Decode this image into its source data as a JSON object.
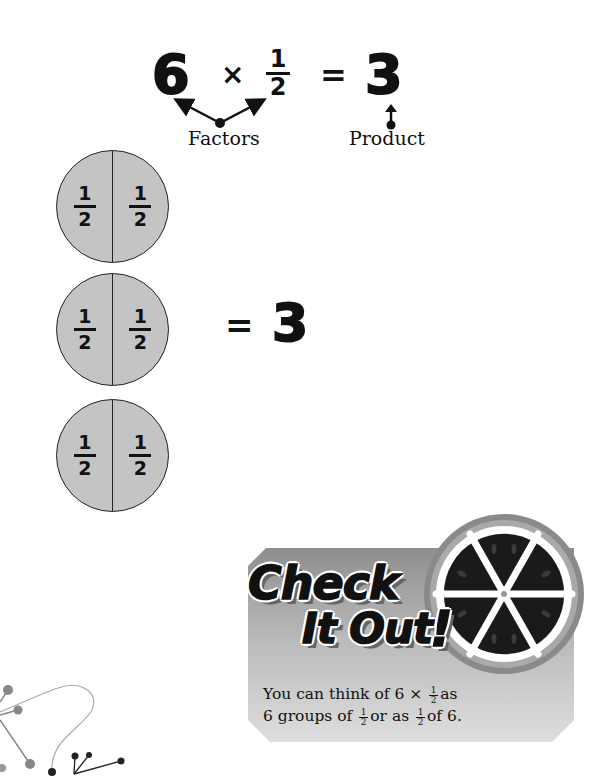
{
  "equation": {
    "factor1": "6",
    "times": "×",
    "factor2": {
      "numerator": "1",
      "denominator": "2"
    },
    "equals": "=",
    "product": "3",
    "factors_label": "Factors",
    "product_label": "Product"
  },
  "groups": [
    {
      "halves": [
        {
          "numerator": "1",
          "denominator": "2"
        },
        {
          "numerator": "1",
          "denominator": "2"
        }
      ]
    },
    {
      "halves": [
        {
          "numerator": "1",
          "denominator": "2"
        },
        {
          "numerator": "1",
          "denominator": "2"
        }
      ]
    },
    {
      "halves": [
        {
          "numerator": "1",
          "denominator": "2"
        },
        {
          "numerator": "1",
          "denominator": "2"
        }
      ]
    }
  ],
  "group_result": {
    "equals": "=",
    "value": "3"
  },
  "check_it_out": {
    "title_line1": "Check",
    "title_line2": "It Out",
    "exclaim": "!",
    "text": {
      "l1_a": "You can think of 6 × ",
      "l1_b": "as",
      "l2_a": "6 groups of ",
      "l2_b": "or as ",
      "l2_c": "of 6.",
      "frac": {
        "numerator": "1",
        "denominator": "2"
      }
    }
  },
  "colors": {
    "circle_fill": "#c4c4c4",
    "ink": "#111111",
    "panel_top": "#8e8e8e",
    "panel_bottom": "#dedede"
  }
}
